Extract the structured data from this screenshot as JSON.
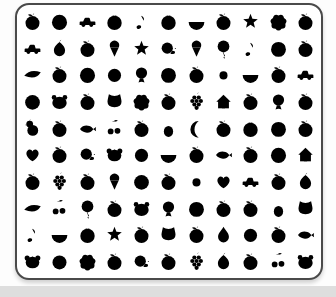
{
  "page": {
    "background": "#fdfdfd",
    "bottom_strip_color": "#dedede"
  },
  "board": {
    "background": "#ffffff",
    "border_color": "#4a4a4a",
    "stroke_color": "#5a5a5a",
    "dark_fill_color": "#3a3a3a",
    "mid_fill_color": "#8d8d8d",
    "columns": 11,
    "rows": 10,
    "grid": [
      [
        "apple",
        "circle",
        "car",
        "orange",
        "note",
        "orange",
        "watermelon",
        "apple",
        "star",
        "fluff",
        "apple"
      ],
      [
        "car",
        "pear",
        "apple",
        "icecream",
        "star",
        "snail",
        "icecream",
        "balloon",
        "note",
        "baseball",
        "apple"
      ],
      [
        "leaf",
        "apple",
        "circle",
        "lattice-ball",
        "round-fish",
        "baseball",
        "apple",
        "sun",
        "watermelon",
        "apple",
        "car"
      ],
      [
        "target",
        "panda",
        "apple",
        "cat",
        "fluff",
        "apple",
        "grapes",
        "house",
        "apple",
        "round-fish",
        "apple"
      ],
      [
        "chick",
        "apple",
        "fish",
        "cherries",
        "apple",
        "pineapple",
        "moon",
        "apple",
        "orange",
        "baseball",
        "apple"
      ],
      [
        "heart",
        "apple",
        "snail",
        "dog",
        "lattice-ball",
        "watermelon",
        "apple",
        "fish",
        "apple",
        "circle",
        "house"
      ],
      [
        "apple",
        "grapes",
        "apple",
        "icecream",
        "target",
        "apple",
        "sun",
        "heart",
        "car",
        "apple",
        "pear"
      ],
      [
        "leaf",
        "cherries",
        "balloon",
        "apple",
        "panda",
        "round-fish",
        "baseball",
        "apple",
        "apple",
        "pineapple",
        "cat"
      ],
      [
        "note",
        "watermelon",
        "orange",
        "star",
        "apple",
        "cat",
        "apple",
        "drop",
        "lattice-ball",
        "apple",
        "fish"
      ],
      [
        "dog",
        "smiley",
        "fluff",
        "apple",
        "snail",
        "apple",
        "grapes",
        "pear",
        "apple",
        "cherries",
        "panda"
      ]
    ]
  }
}
